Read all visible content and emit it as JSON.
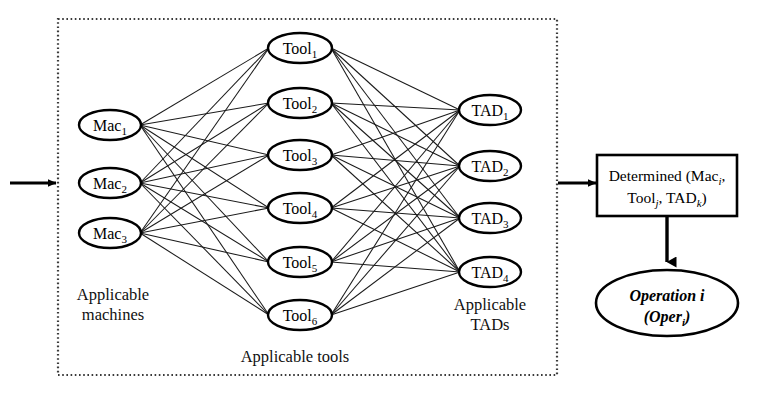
{
  "diagram": {
    "container": {
      "name": "dotted-container",
      "border_style": "dotted",
      "color": "#444444",
      "x": 58,
      "y": 19,
      "width": 499,
      "height": 356
    },
    "input_arrow": {
      "name": "input-arrow",
      "from_x": 10,
      "to_x": 56,
      "y": 183
    },
    "layers": [
      {
        "id": "machines",
        "caption": "Applicable\nmachines",
        "caption_lines": [
          "Applicable",
          "machines"
        ],
        "caption_x": 113,
        "caption_y": 300,
        "cx": 110,
        "rx": 31,
        "ry": 15,
        "nodes": [
          {
            "base": "Mac",
            "sub": "1",
            "label": "Mac1",
            "cy": 125
          },
          {
            "base": "Mac",
            "sub": "2",
            "label": "Mac2",
            "cy": 183
          },
          {
            "base": "Mac",
            "sub": "3",
            "label": "Mac3",
            "cy": 233
          }
        ]
      },
      {
        "id": "tools",
        "caption": "Applicable tools",
        "caption_lines": [
          "Applicable tools"
        ],
        "caption_x": 295,
        "caption_y": 362,
        "cx": 300,
        "rx": 32,
        "ry": 15,
        "nodes": [
          {
            "base": "Tool",
            "sub": "1",
            "label": "Tool1",
            "cy": 48
          },
          {
            "base": "Tool",
            "sub": "2",
            "label": "Tool2",
            "cy": 103
          },
          {
            "base": "Tool",
            "sub": "3",
            "label": "Tool3",
            "cy": 155
          },
          {
            "base": "Tool",
            "sub": "4",
            "label": "Tool4",
            "cy": 208
          },
          {
            "base": "Tool",
            "sub": "5",
            "label": "Tool5",
            "cy": 262
          },
          {
            "base": "Tool",
            "sub": "6",
            "label": "Tool6",
            "cy": 315
          }
        ]
      },
      {
        "id": "tads",
        "caption": "Applicable\nTADs",
        "caption_lines": [
          "Applicable",
          "TADs"
        ],
        "caption_x": 490,
        "caption_y": 310,
        "cx": 490,
        "rx": 31,
        "ry": 15,
        "nodes": [
          {
            "base": "TAD",
            "sub": "1",
            "label": "TAD1",
            "cy": 110
          },
          {
            "base": "TAD",
            "sub": "2",
            "label": "TAD2",
            "cy": 166
          },
          {
            "base": "TAD",
            "sub": "3",
            "label": "TAD3",
            "cy": 218
          },
          {
            "base": "TAD",
            "sub": "4",
            "label": "TAD4",
            "cy": 272
          }
        ]
      }
    ],
    "result_arrow": {
      "name": "result-arrow",
      "from_x": 558,
      "to_x": 596,
      "y": 183
    },
    "determined_box": {
      "name": "determined-box",
      "x": 597,
      "y": 155,
      "width": 140,
      "height": 61,
      "line1_pre": "Determined (Mac",
      "line1_sub": "i",
      "line1_post": ",",
      "line2_pre": "Tool",
      "line2_sub1": "j",
      "line2_mid": ", TAD",
      "line2_sub2": "k",
      "line2_post": ")"
    },
    "down_arrow": {
      "name": "down-arrow",
      "x": 667,
      "from_y": 216,
      "to_y": 262
    },
    "operation_ellipse": {
      "name": "operation-ellipse",
      "cx": 667,
      "cy": 303,
      "rx": 71,
      "ry": 33,
      "line1": "Operation i",
      "line2_pre": "(Oper",
      "line2_sub": "i",
      "line2_post": ")"
    },
    "colors": {
      "stroke": "#000000",
      "edge": "#1a1a1a",
      "dotted": "#3a3a3a",
      "background": "#ffffff"
    }
  }
}
